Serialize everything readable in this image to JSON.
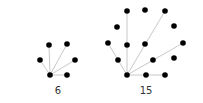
{
  "diagrams": [
    {
      "label": "6",
      "label_pos": [
        58,
        94
      ],
      "hub": [
        50,
        75
      ],
      "nodes": [
        [
          50,
          75
        ],
        [
          40,
          60
        ],
        [
          49,
          45
        ],
        [
          67,
          44
        ],
        [
          75,
          60
        ],
        [
          67,
          75
        ]
      ],
      "edges": [
        [
          [
            50,
            75
          ],
          [
            40,
            60
          ]
        ],
        [
          [
            50,
            75
          ],
          [
            49,
            45
          ]
        ],
        [
          [
            50,
            75
          ],
          [
            67,
            44
          ]
        ],
        [
          [
            50,
            75
          ],
          [
            75,
            60
          ]
        ],
        [
          [
            50,
            75
          ],
          [
            67,
            75
          ]
        ]
      ]
    },
    {
      "label": "15",
      "label_pos": [
        146,
        94
      ],
      "hub": [
        127,
        75
      ],
      "nodes": [
        [
          127,
          75
        ],
        [
          118,
          60
        ],
        [
          108,
          43
        ],
        [
          117,
          27
        ],
        [
          127,
          11
        ],
        [
          127,
          45
        ],
        [
          145,
          10
        ],
        [
          145,
          44
        ],
        [
          165,
          11
        ],
        [
          174,
          26
        ],
        [
          183,
          43
        ],
        [
          153,
          60
        ],
        [
          174,
          58
        ],
        [
          146,
          75
        ],
        [
          165,
          75
        ]
      ],
      "edges": [
        [
          [
            127,
            75
          ],
          [
            118,
            60
          ]
        ],
        [
          [
            118,
            60
          ],
          [
            108,
            43
          ]
        ],
        [
          [
            127,
            75
          ],
          [
            127,
            11
          ]
        ],
        [
          [
            127,
            75
          ],
          [
            165,
            11
          ]
        ],
        [
          [
            127,
            75
          ],
          [
            183,
            43
          ]
        ],
        [
          [
            127,
            75
          ],
          [
            146,
            75
          ]
        ],
        [
          [
            146,
            75
          ],
          [
            165,
            75
          ]
        ]
      ]
    }
  ],
  "colors": {
    "node": "#000000",
    "edge": "#c8c8c8",
    "label": "#333333",
    "background": "#ffffff"
  }
}
